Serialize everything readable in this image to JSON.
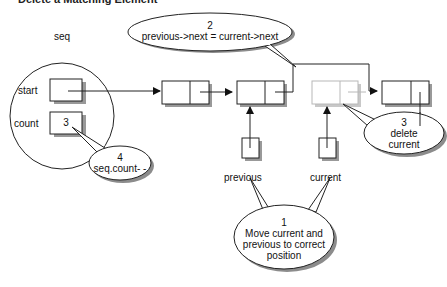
{
  "title_clipped": "Delete a Matching Element",
  "struct": {
    "name": "seq",
    "fields": [
      {
        "label": "start",
        "value": ""
      },
      {
        "label": "count",
        "value": "3"
      }
    ]
  },
  "pointers": [
    {
      "label": "previous"
    },
    {
      "label": "current"
    }
  ],
  "callouts": [
    {
      "number": "1",
      "lines": [
        "Move current and",
        "previous to correct",
        "position"
      ]
    },
    {
      "number": "2",
      "lines": [
        "previous->next = current->next"
      ]
    },
    {
      "number": "3",
      "lines": [
        "delete",
        "current"
      ]
    },
    {
      "number": "4",
      "lines": [
        "seq.count- -"
      ]
    }
  ],
  "colors": {
    "stroke": "#222222",
    "shadow": "#9a9a9a",
    "faded_node": "#b8b8b8",
    "callout_shadow": "#8c8c8c"
  }
}
